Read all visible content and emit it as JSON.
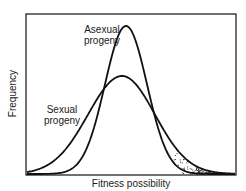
{
  "chart_data": {
    "type": "line",
    "title": "",
    "xlabel": "Fitness possibility",
    "ylabel": "Frequency",
    "grid": false,
    "legend": "none (inline annotations)",
    "x": [
      0,
      0.1,
      0.2,
      0.3,
      0.4,
      0.5,
      0.6,
      0.7,
      0.8,
      0.9,
      1.0
    ],
    "series": [
      {
        "name": "Asexual progeny",
        "peak_x": 0.48,
        "peak_y": 1.0,
        "spread": "narrow",
        "values": [
          0.0,
          0.01,
          0.05,
          0.22,
          0.65,
          0.99,
          0.72,
          0.25,
          0.05,
          0.01,
          0.0
        ]
      },
      {
        "name": "Sexual progeny",
        "peak_x": 0.46,
        "peak_y": 0.66,
        "spread": "wide",
        "values": [
          0.02,
          0.08,
          0.2,
          0.4,
          0.6,
          0.66,
          0.55,
          0.35,
          0.16,
          0.05,
          0.01
        ]
      }
    ],
    "annotations": [
      "Asexual progeny",
      "Sexual progeny",
      "stippled area under right tail of sexual curve"
    ],
    "xlim": [
      0,
      1
    ],
    "ylim": [
      0,
      1.05
    ]
  },
  "labels": {
    "asexual_line1": "Asexual",
    "asexual_line2": "progeny",
    "sexual_line1": "Sexual",
    "sexual_line2": "progeny",
    "xlabel": "Fitness possibility",
    "ylabel": "Frequency"
  }
}
